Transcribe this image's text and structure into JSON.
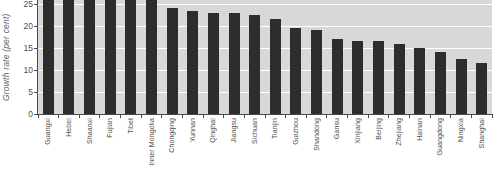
{
  "chart_data": {
    "type": "bar",
    "title": "",
    "xlabel": "",
    "ylabel": "Growth rate (per cent)",
    "categories": [
      "Guangxi",
      "Hebei",
      "Shaanxi",
      "Fujian",
      "Tibet",
      "Inner Mongolia",
      "Chongqing",
      "Yunnan",
      "Qinghai",
      "Jiangsu",
      "Sichuan",
      "Tianjin",
      "Guizhou",
      "Shandong",
      "Gansu",
      "Xinjiang",
      "Beijing",
      "Zhejiang",
      "Hainan",
      "Guangdong",
      "Ningxia",
      "Shanghai"
    ],
    "values": [
      27,
      27,
      27,
      27,
      27,
      27,
      24,
      23.5,
      23,
      23,
      22.5,
      21.5,
      19.5,
      19,
      17,
      16.5,
      16.5,
      16,
      15,
      14,
      12.5,
      11.5
    ],
    "clipped_at_top": [
      "Guangxi",
      "Hebei",
      "Shaanxi",
      "Fujian",
      "Tibet",
      "Inner Mongolia"
    ],
    "clip_note": "The six leftmost bars run past the cropped top edge of the screenshot, so their true values are not visible; 27 is a render stand-in.",
    "yticks": [
      0,
      5,
      10,
      15,
      20,
      25
    ],
    "ylim_visible": [
      0,
      25.9
    ],
    "grid": "horizontal white gridlines every 5 units",
    "legend": "none",
    "colors": {
      "bar": "#2d2d2d",
      "plot_background": "#d8d8d8",
      "gridline": "#ffffff",
      "axis_line": "#4a4a4a",
      "tick_label_text": "#4d4d4d",
      "axis_title_text": "#666666",
      "page_background": "#ffffff"
    }
  }
}
